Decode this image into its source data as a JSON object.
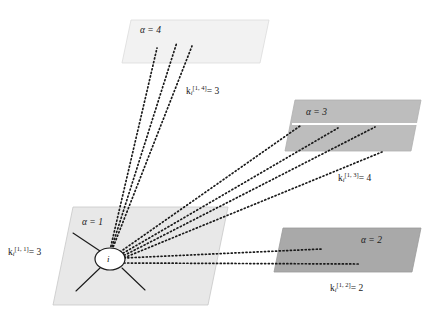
{
  "figure": {
    "background_color": "#ffffff",
    "node": {
      "label": "i",
      "center_x": 110,
      "center_y": 259,
      "rx": 15,
      "ry": 11
    },
    "layers": [
      {
        "id": "layer-alpha-1",
        "alpha_label": "α = 1",
        "alpha_symbol": "α",
        "alpha_eq": "=",
        "alpha_value": "1",
        "fill": "#e8e8e8",
        "stroke": "#c8c8c8",
        "points": "73,207 228,207 208,305 53,305",
        "label_x": 82,
        "label_y": 223,
        "degree_label": "k",
        "degree_sub": "i",
        "degree_sup": "[1, 1]",
        "degree_eq": "= 3",
        "degree_value": 3,
        "degree_label_x": 8,
        "degree_label_y": 251
      },
      {
        "id": "layer-alpha-2",
        "alpha_label": "α = 2",
        "alpha_symbol": "α",
        "alpha_eq": "=",
        "alpha_value": "2",
        "fill": "#a9a9a9",
        "stroke": "#9a9a9a",
        "points": "283,228 421,228 412,272 274,272",
        "label_x": 361,
        "label_y": 241,
        "degree_label": "k",
        "degree_sub": "i",
        "degree_sup": "[1, 2]",
        "degree_eq": "= 2",
        "degree_value": 2,
        "degree_label_x": 330,
        "degree_label_y": 287
      },
      {
        "id": "layer-alpha-3",
        "alpha_label": "α = 3",
        "alpha_symbol": "α",
        "alpha_eq": "=",
        "alpha_value": "3",
        "fill": "#bdbdbd",
        "stroke": "#b0b0b0",
        "points": "295,100 421,100 411,151 285,151",
        "label_x": 306,
        "label_y": 113,
        "divider_y": 124,
        "degree_label": "k",
        "degree_sub": "i",
        "degree_sup": "[1, 3]",
        "degree_eq": "= 4",
        "degree_value": 4,
        "degree_label_x": 338,
        "degree_label_y": 177
      },
      {
        "id": "layer-alpha-4",
        "alpha_label": "α = 4",
        "alpha_symbol": "α",
        "alpha_eq": "=",
        "alpha_value": "4",
        "fill": "#f2f2f2",
        "stroke": "#dcdcdc",
        "points": "131,20 269,20 260,63 122,63",
        "label_x": 140,
        "label_y": 31,
        "degree_label": "k",
        "degree_sub": "i",
        "degree_sup": "[1, 4]",
        "degree_eq": "= 3",
        "degree_value": 3,
        "degree_label_x": 186,
        "degree_label_y": 90
      }
    ],
    "intralayer_links": {
      "style": "solid",
      "color": "#1a1a1a",
      "count": 3,
      "segments": [
        {
          "x1": 100,
          "y1": 251,
          "x2": 73,
          "y2": 233
        },
        {
          "x1": 100,
          "y1": 268,
          "x2": 76,
          "y2": 291
        },
        {
          "x1": 122,
          "y1": 268,
          "x2": 145,
          "y2": 290
        }
      ]
    },
    "interlayer_links": {
      "style": "dotted",
      "color": "#1a1a1a",
      "groups": [
        {
          "target": "layer-alpha-4",
          "count": 3,
          "segments": [
            {
              "x1": 110,
              "y1": 250,
              "x2": 157,
              "y2": 48
            },
            {
              "x1": 111,
              "y1": 250,
              "x2": 177,
              "y2": 42
            },
            {
              "x1": 112,
              "y1": 250,
              "x2": 192,
              "y2": 46
            }
          ]
        },
        {
          "target": "layer-alpha-3",
          "count": 4,
          "segments": [
            {
              "x1": 120,
              "y1": 253,
              "x2": 300,
              "y2": 126
            },
            {
              "x1": 120,
              "y1": 255,
              "x2": 338,
              "y2": 128
            },
            {
              "x1": 121,
              "y1": 257,
              "x2": 375,
              "y2": 127
            },
            {
              "x1": 121,
              "y1": 259,
              "x2": 382,
              "y2": 152
            }
          ]
        },
        {
          "target": "layer-alpha-2",
          "count": 2,
          "segments": [
            {
              "x1": 124,
              "y1": 258,
              "x2": 322,
              "y2": 249
            },
            {
              "x1": 124,
              "y1": 263,
              "x2": 360,
              "y2": 264
            }
          ]
        }
      ]
    }
  }
}
